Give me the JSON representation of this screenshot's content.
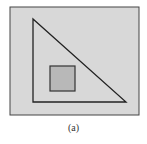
{
  "figure": {
    "caption": "(a)",
    "colors": {
      "outer_fill": "#d8d8d8",
      "outer_stroke": "#444444",
      "triangle_stroke": "#222222",
      "square_fill": "#b8b8b8",
      "square_stroke": "#333333"
    },
    "shapes": {
      "outer_rect": {
        "x": 10,
        "y": 7,
        "w": 129,
        "h": 108
      },
      "triangle": [
        [
          33,
          19
        ],
        [
          33,
          102
        ],
        [
          126,
          102
        ]
      ],
      "inner_square": {
        "x": 50,
        "y": 66,
        "w": 25,
        "h": 25
      }
    }
  }
}
